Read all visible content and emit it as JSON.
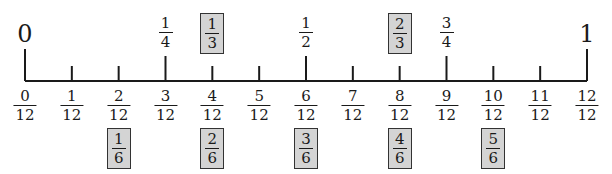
{
  "number_line": {
    "x_start": 25,
    "x_end": 587,
    "baseline_y": 81,
    "divisions": 12,
    "endpoints": [
      {
        "label": "0",
        "position": 0
      },
      {
        "label": "1",
        "position": 12
      }
    ],
    "top_fractions": [
      {
        "num": "1",
        "den": "4",
        "position": 3,
        "boxed": false
      },
      {
        "num": "1",
        "den": "3",
        "position": 4,
        "boxed": true
      },
      {
        "num": "1",
        "den": "2",
        "position": 6,
        "boxed": false
      },
      {
        "num": "2",
        "den": "3",
        "position": 8,
        "boxed": true
      },
      {
        "num": "3",
        "den": "4",
        "position": 9,
        "boxed": false
      }
    ],
    "twelfths": [
      {
        "num": "0",
        "den": "12"
      },
      {
        "num": "1",
        "den": "12"
      },
      {
        "num": "2",
        "den": "12"
      },
      {
        "num": "3",
        "den": "12"
      },
      {
        "num": "4",
        "den": "12"
      },
      {
        "num": "5",
        "den": "12"
      },
      {
        "num": "6",
        "den": "12"
      },
      {
        "num": "7",
        "den": "12"
      },
      {
        "num": "8",
        "den": "12"
      },
      {
        "num": "9",
        "den": "12"
      },
      {
        "num": "10",
        "den": "12"
      },
      {
        "num": "11",
        "den": "12"
      },
      {
        "num": "12",
        "den": "12"
      }
    ],
    "sixths": [
      {
        "num": "1",
        "den": "6",
        "position": 2
      },
      {
        "num": "2",
        "den": "6",
        "position": 4
      },
      {
        "num": "3",
        "den": "6",
        "position": 6
      },
      {
        "num": "4",
        "den": "6",
        "position": 8
      },
      {
        "num": "5",
        "den": "6",
        "position": 10
      }
    ],
    "long_tick_positions": [
      0,
      3,
      6,
      9,
      12
    ],
    "colors": {
      "line": "#1a1a1a",
      "box_fill": "#d4d4d4",
      "box_border": "#333333"
    }
  }
}
